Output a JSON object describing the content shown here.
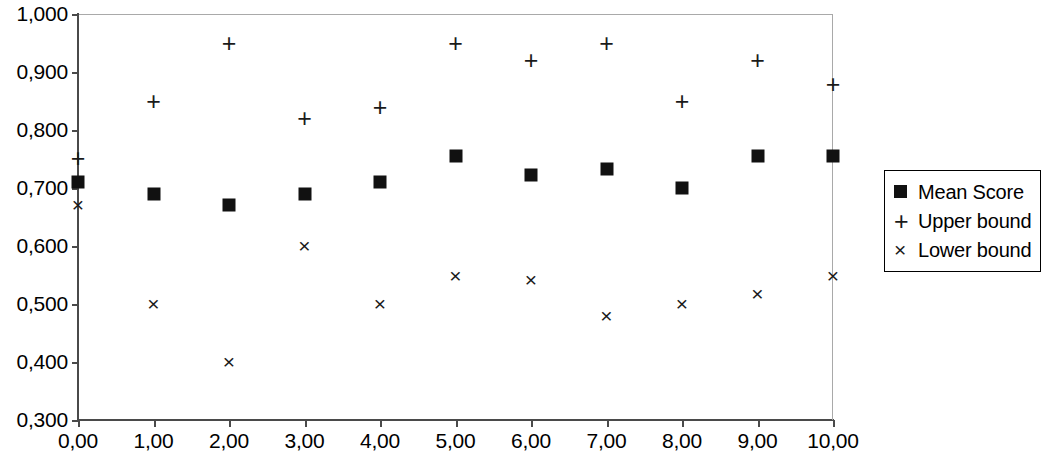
{
  "chart_data": {
    "type": "scatter",
    "title": "",
    "xlabel": "",
    "ylabel": "",
    "xlim": [
      0,
      10
    ],
    "ylim": [
      0.3,
      1.0
    ],
    "grid": false,
    "legend_position": "right",
    "decimal_separator": ",",
    "x": [
      0,
      1,
      2,
      3,
      4,
      5,
      6,
      7,
      8,
      9,
      10
    ],
    "x_tick_labels": [
      "0,00",
      "1,00",
      "2,00",
      "3,00",
      "4,00",
      "5,00",
      "6,00",
      "7,00",
      "8,00",
      "9,00",
      "10,00"
    ],
    "y_tick_values": [
      1.0,
      0.9,
      0.8,
      0.7,
      0.6,
      0.5,
      0.4,
      0.3
    ],
    "y_tick_labels": [
      "1,000",
      "0,900",
      "0,800",
      "0,700",
      "0,600",
      "0,500",
      "0,400",
      "0,300"
    ],
    "series": [
      {
        "name": "Mean Score",
        "marker": "square",
        "glyph": "■",
        "color": "#111111",
        "values": [
          0.711,
          0.69,
          0.67,
          0.69,
          0.71,
          0.755,
          0.722,
          0.733,
          0.7,
          0.755,
          0.755
        ]
      },
      {
        "name": "Upper bound",
        "marker": "plus",
        "glyph": "+",
        "color": "#1a1a1a",
        "values": [
          0.752,
          0.85,
          0.95,
          0.82,
          0.84,
          0.95,
          0.92,
          0.95,
          0.85,
          0.92,
          0.88
        ]
      },
      {
        "name": "Lower bound",
        "marker": "cross",
        "glyph": "×",
        "color": "#1a1a1a",
        "values": [
          0.671,
          0.5,
          0.4,
          0.6,
          0.5,
          0.548,
          0.541,
          0.48,
          0.5,
          0.518,
          0.548
        ]
      }
    ]
  },
  "legend": {
    "items": [
      {
        "label": "Mean Score",
        "glyph": "■",
        "marker": "square"
      },
      {
        "label": "Upper bound",
        "glyph": "+",
        "marker": "plus"
      },
      {
        "label": "Lower bound",
        "glyph": "×",
        "marker": "cross"
      }
    ]
  },
  "colors": {
    "marker": "#111111",
    "axis": "#4a4a4a",
    "frame": "#a9a9a9",
    "background": "#ffffff"
  }
}
